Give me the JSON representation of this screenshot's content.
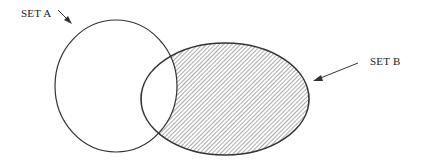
{
  "diagram": {
    "type": "venn",
    "sets": [
      {
        "id": "A",
        "label": "SET A",
        "shaded": false
      },
      {
        "id": "B",
        "label": "SET B",
        "shaded": true
      }
    ],
    "shaded_region": "B minus A",
    "colors": {
      "stroke": "#333333",
      "hatch": "#555555",
      "background": "#ffffff"
    }
  }
}
